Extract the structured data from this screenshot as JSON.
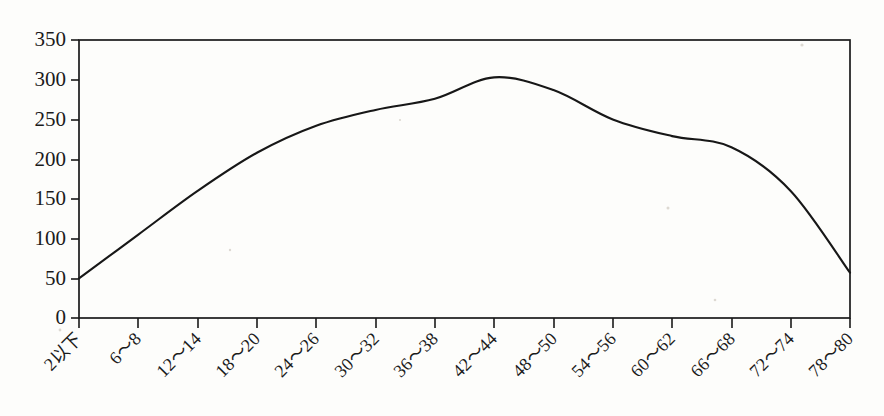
{
  "chart_data": {
    "type": "line",
    "title": "",
    "subtitle": "",
    "xlabel": "",
    "ylabel": "",
    "grid": false,
    "legend": false,
    "legend_position": "none",
    "axis_frame": "box",
    "xlim": [
      0,
      13
    ],
    "ylim": [
      0,
      350
    ],
    "ytick_values": [
      0,
      50,
      100,
      150,
      200,
      250,
      300,
      350
    ],
    "ytick_labels": [
      "0",
      "50",
      "100",
      "150",
      "200",
      "250",
      "300",
      "350"
    ],
    "categories": [
      "2以下",
      "6～8",
      "12～14",
      "18～20",
      "24～26",
      "30～32",
      "36～38",
      "42～44",
      "48～50",
      "54～56",
      "60～62",
      "66～68",
      "72～74",
      "78～80"
    ],
    "values": [
      50,
      105,
      160,
      208,
      242,
      262,
      276,
      303,
      287,
      250,
      229,
      215,
      160,
      57
    ],
    "series": [
      {
        "name": "",
        "color": "#171717",
        "values": [
          50,
          105,
          160,
          208,
          242,
          262,
          276,
          303,
          287,
          250,
          229,
          215,
          160,
          57
        ]
      }
    ],
    "smoothing": "curved",
    "marker": "none"
  },
  "figure": {
    "background_color": "#fdfdfb",
    "line_color": "#171717",
    "axis_color": "#1a1a1a",
    "text_color": "#1b1b1b",
    "xlabel_rotation_deg": 45
  }
}
